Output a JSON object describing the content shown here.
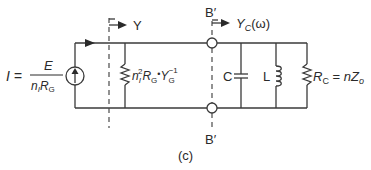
{
  "figure": {
    "caption": "(c)",
    "source_label": {
      "lhs": "I =",
      "numerator": "E",
      "denominator_n": "n",
      "denominator_n_sub": "I",
      "denominator_R": "R",
      "denominator_R_sub": "G"
    },
    "ref_plane_left": {
      "label": "Y"
    },
    "ref_plane_right": {
      "top_label": "B′",
      "bottom_label": "B′",
      "admittance_Y": "Y",
      "admittance_sub": "C",
      "admittance_arg": "(ω)"
    },
    "shunt_resistor_label": {
      "n": "n",
      "n_sub": "I",
      "n_sup": "2",
      "R": "R",
      "R_sub": "G",
      "dot": "•",
      "Y": "Y",
      "Y_sub": "G",
      "Y_sup": "−1"
    },
    "capacitor_label": "C",
    "inductor_label": "L",
    "load_resistor_label": {
      "R": "R",
      "R_sub": "C",
      "eq": " = ",
      "n": "n",
      "Z": "Z",
      "Z_sub": "o"
    }
  }
}
